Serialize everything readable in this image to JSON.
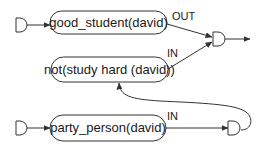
{
  "diagram": {
    "type": "logic-network",
    "colors": {
      "stroke": "#333333",
      "text": "#1a1a1a",
      "background": "#ffffff"
    },
    "nodes": [
      {
        "id": "good_student",
        "label": "good_student(david)"
      },
      {
        "id": "not_study_hard",
        "label": "not(study hard (david))"
      },
      {
        "id": "party_person",
        "label": "party_person(david)"
      }
    ],
    "gates": [
      {
        "id": "input-gate-top",
        "shape": "d-gate"
      },
      {
        "id": "and-gate-top",
        "shape": "d-gate"
      },
      {
        "id": "input-gate-bottom",
        "shape": "d-gate"
      },
      {
        "id": "and-gate-bottom",
        "shape": "d-gate"
      }
    ],
    "edge_labels": {
      "good_student_to_and": "OUT",
      "not_study_to_and": "IN",
      "party_person_to_and": "IN"
    },
    "edges": [
      {
        "from": "input-gate-top",
        "to": "good_student"
      },
      {
        "from": "good_student",
        "to": "and-gate-top",
        "label": "OUT"
      },
      {
        "from": "not_study_hard",
        "to": "and-gate-top",
        "label": "IN"
      },
      {
        "from": "and-gate-top",
        "to": "output"
      },
      {
        "from": "input-gate-bottom",
        "to": "party_person"
      },
      {
        "from": "party_person",
        "to": "and-gate-bottom",
        "label": "IN"
      },
      {
        "from": "and-gate-bottom",
        "to": "not_study_hard"
      }
    ]
  }
}
